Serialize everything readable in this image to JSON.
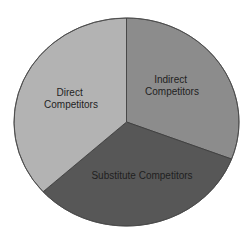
{
  "chart_data": {
    "type": "pie",
    "title": "",
    "labels": [
      "Direct Competitors",
      "Indirect Competitors",
      "Substitute Competitors"
    ],
    "values": [
      36.7,
      30.8,
      32.5
    ],
    "colors": [
      "#b3b3b3",
      "#8c8c8c",
      "#575757"
    ],
    "start_angle_deg": 0,
    "direction": "clockwise",
    "legend": "none",
    "slice_order_clockwise_from_top": [
      "Indirect Competitors",
      "Substitute Competitors",
      "Direct Competitors"
    ],
    "slices": [
      {
        "name": "Indirect Competitors",
        "lines": [
          "Indirect",
          "Competitors"
        ],
        "value": 30.8,
        "color": "#8c8c8c"
      },
      {
        "name": "Substitute Competitors",
        "lines": [
          "Substitute Competitors"
        ],
        "value": 32.5,
        "color": "#575757"
      },
      {
        "name": "Direct Competitors",
        "lines": [
          "Direct",
          "Competitors"
        ],
        "value": 36.7,
        "color": "#b3b3b3"
      }
    ]
  }
}
